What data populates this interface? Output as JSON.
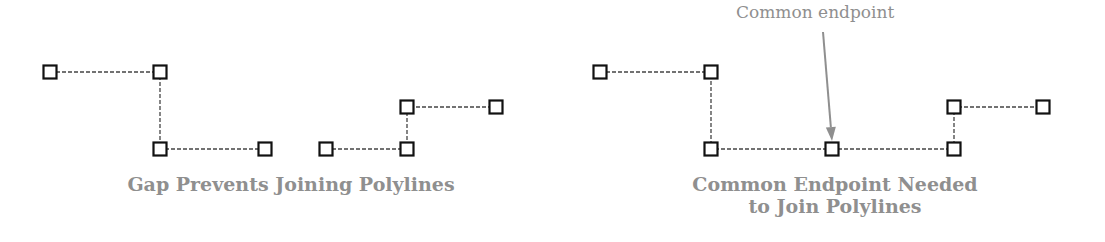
{
  "colors": {
    "vertex_stroke": "#111111",
    "segment": "#444444",
    "caption": "#8f8f8f",
    "arrow": "#8f8f8f",
    "background": "#ffffff"
  },
  "left_panel": {
    "caption": "Gap Prevents Joining Polylines",
    "polylines": [
      {
        "name": "polyline-a",
        "points": [
          [
            50,
            72
          ],
          [
            160,
            72
          ],
          [
            160,
            149
          ],
          [
            265,
            149
          ]
        ]
      },
      {
        "name": "polyline-b",
        "points": [
          [
            326,
            149
          ],
          [
            407,
            149
          ],
          [
            407,
            107
          ],
          [
            496,
            107
          ]
        ]
      }
    ]
  },
  "right_panel": {
    "caption_line1": "Common Endpoint Needed",
    "caption_line2": "to Join Polylines",
    "callout_label": "Common endpoint",
    "callout_arrow": {
      "from": [
        823,
        32
      ],
      "to": [
        832,
        141
      ]
    },
    "polylines": [
      {
        "name": "polyline-a",
        "points": [
          [
            600,
            72
          ],
          [
            711,
            72
          ],
          [
            711,
            149
          ],
          [
            832,
            149
          ]
        ]
      },
      {
        "name": "polyline-b",
        "points": [
          [
            832,
            149
          ],
          [
            954,
            149
          ],
          [
            954,
            107
          ],
          [
            1043,
            107
          ]
        ]
      }
    ]
  }
}
